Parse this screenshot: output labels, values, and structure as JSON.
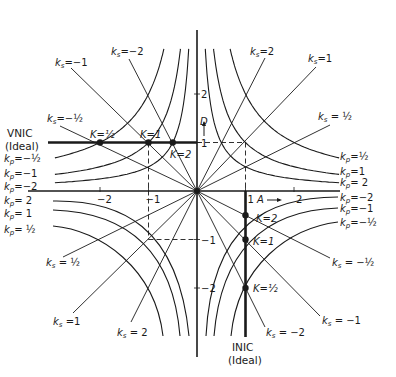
{
  "diagram": {
    "origin_px": [
      197,
      191
    ],
    "unit_px": 48.5,
    "axes": {
      "x_label": "A",
      "y_label": "D",
      "x_ticks": [
        {
          "value": -2,
          "label": "−2"
        },
        {
          "value": -1,
          "label": "−1"
        },
        {
          "value": 1,
          "label": "1"
        },
        {
          "value": 2,
          "label": "2"
        }
      ],
      "y_ticks": [
        {
          "value": 2,
          "label": "2"
        },
        {
          "value": 1,
          "label": "1"
        },
        {
          "value": -1,
          "label": "−1"
        },
        {
          "value": -2,
          "label": "−2"
        }
      ]
    },
    "ideal_lines": {
      "vnic": {
        "label_line1": "VNIC",
        "label_line2": "(Ideal)",
        "D": 1
      },
      "inic": {
        "label_line1": "INIC",
        "label_line2": "(Ideal)",
        "A": 1
      }
    },
    "ks_lines": [
      {
        "quadrant": 1,
        "label": "k",
        "sub": "s",
        "value": "=2",
        "end": [
          265,
          58
        ],
        "text_at": [
          250,
          55
        ]
      },
      {
        "quadrant": 1,
        "label": "k",
        "sub": "s",
        "value": "=1",
        "end": [
          316,
          67
        ],
        "text_at": [
          308,
          62
        ]
      },
      {
        "quadrant": 1,
        "label": "k",
        "sub": "s",
        "value": " = ½",
        "end": [
          330,
          125
        ],
        "text_at": [
          318,
          120
        ]
      },
      {
        "quadrant": 2,
        "label": "k",
        "sub": "s",
        "value": "=−1",
        "end": [
          71,
          68
        ],
        "text_at": [
          55,
          66
        ]
      },
      {
        "quadrant": 2,
        "label": "k",
        "sub": "s",
        "value": "=−2",
        "end": [
          129,
          59
        ],
        "text_at": [
          111,
          55
        ]
      },
      {
        "quadrant": 2,
        "label": "k",
        "sub": "s",
        "value": "=−½",
        "end": [
          60,
          126
        ],
        "text_at": [
          47,
          122
        ]
      },
      {
        "quadrant": 3,
        "label": "k",
        "sub": "s",
        "value": " = ½",
        "end": [
          63,
          257
        ],
        "text_at": [
          46,
          266
        ]
      },
      {
        "quadrant": 3,
        "label": "k",
        "sub": "s",
        "value": " =1",
        "end": [
          73,
          313
        ],
        "text_at": [
          53,
          325
        ]
      },
      {
        "quadrant": 3,
        "label": "k",
        "sub": "s",
        "value": " = 2",
        "end": [
          131,
          322
        ],
        "text_at": [
          117,
          336
        ]
      },
      {
        "quadrant": 4,
        "label": "k",
        "sub": "s",
        "value": " = −½",
        "end": [
          330,
          258
        ],
        "text_at": [
          332,
          266
        ]
      },
      {
        "quadrant": 4,
        "label": "k",
        "sub": "s",
        "value": " = −1",
        "end": [
          320,
          316
        ],
        "text_at": [
          322,
          324
        ]
      },
      {
        "quadrant": 4,
        "label": "k",
        "sub": "s",
        "value": " = −2",
        "end": [
          265,
          327
        ],
        "text_at": [
          266,
          336
        ]
      }
    ],
    "kp_curves": [
      {
        "quadrant": 1,
        "label": "k",
        "sub": "p",
        "value": "=½",
        "xy": 2,
        "text_at": [
          340,
          160
        ]
      },
      {
        "quadrant": 1,
        "label": "k",
        "sub": "p",
        "value": "=1",
        "xy": 1,
        "text_at": [
          340,
          175
        ]
      },
      {
        "quadrant": 1,
        "label": "k",
        "sub": "p",
        "value": "= 2",
        "xy": 0.5,
        "text_at": [
          340,
          186
        ]
      },
      {
        "quadrant": 2,
        "label": "k",
        "sub": "p",
        "value": "=−½",
        "xy": -2,
        "text_at": [
          4,
          162
        ]
      },
      {
        "quadrant": 2,
        "label": "k",
        "sub": "p",
        "value": "=−1",
        "xy": -1,
        "text_at": [
          4,
          177
        ]
      },
      {
        "quadrant": 2,
        "label": "k",
        "sub": "p",
        "value": "=−2",
        "xy": -0.5,
        "text_at": [
          4,
          190
        ]
      },
      {
        "quadrant": 3,
        "label": "k",
        "sub": "p",
        "value": "= 2",
        "path": "M53,201 C120,200 178,225 189,336",
        "text_at": [
          4,
          204
        ]
      },
      {
        "quadrant": 3,
        "label": "k",
        "sub": "p",
        "value": "= 1",
        "path": "M53,210 C115,212 172,240 180,336",
        "text_at": [
          4,
          217
        ]
      },
      {
        "quadrant": 3,
        "label": "k",
        "sub": "p",
        "value": "= ½",
        "path": "M53,226 C100,230 155,268 163,336",
        "text_at": [
          4,
          233
        ]
      },
      {
        "quadrant": 4,
        "label": "k",
        "sub": "p",
        "value": "=−2",
        "path": "M338,197 C270,197 212,222 206,336",
        "text_at": [
          340,
          201
        ]
      },
      {
        "quadrant": 4,
        "label": "k",
        "sub": "p",
        "value": "=−1",
        "path": "M338,208 C275,210 222,240 214,336",
        "text_at": [
          340,
          212
        ]
      },
      {
        "quadrant": 4,
        "label": "k",
        "sub": "p",
        "value": "=−½",
        "path": "M338,222 C290,228 238,264 231,336",
        "text_at": [
          340,
          226
        ]
      }
    ],
    "k_points": [
      {
        "label": "K=½",
        "A": -2,
        "D": 1,
        "text_at": [
          90,
          138
        ]
      },
      {
        "label": "K=1",
        "A": -1,
        "D": 1,
        "text_at": [
          140,
          138
        ]
      },
      {
        "label": "K=2",
        "A": -0.5,
        "D": 1,
        "text_at": [
          170,
          158
        ]
      },
      {
        "label": "K=2",
        "A": 1,
        "D": -0.5,
        "text_at": [
          256,
          222
        ]
      },
      {
        "label": "K=1",
        "A": 1,
        "D": -1,
        "text_at": [
          253,
          245
        ]
      },
      {
        "label": "K=½",
        "A": 1,
        "D": -2,
        "text_at": [
          253,
          292
        ]
      }
    ],
    "dashed_guides": [
      {
        "from": [
          -1,
          1
        ],
        "to": [
          -1,
          -1
        ]
      },
      {
        "from": [
          -1,
          -1
        ],
        "to": [
          0,
          -1
        ]
      },
      {
        "from": [
          1,
          1
        ],
        "to": [
          1,
          0
        ]
      },
      {
        "from": [
          0,
          1
        ],
        "to": [
          1,
          1
        ]
      }
    ],
    "colors": {
      "ink": "#1a1a1a",
      "background": "#ffffff"
    }
  }
}
